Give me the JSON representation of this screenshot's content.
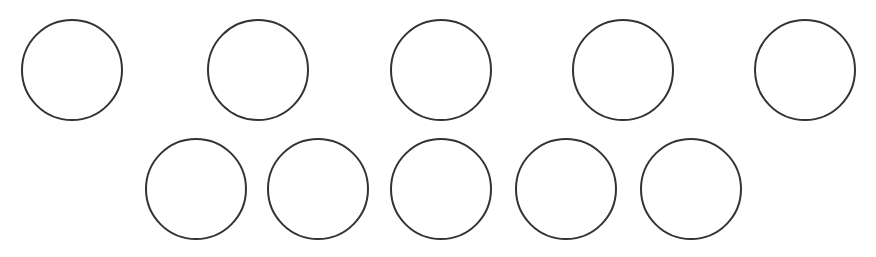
{
  "diagram": {
    "background": "#ffffff",
    "stroke_color": "#333333",
    "stroke_width": 2,
    "rows": [
      {
        "name": "top-row",
        "circles": [
          {
            "cx": 72,
            "cy": 70,
            "r": 51
          },
          {
            "cx": 258,
            "cy": 70,
            "r": 51
          },
          {
            "cx": 441,
            "cy": 70,
            "r": 51
          },
          {
            "cx": 623,
            "cy": 70,
            "r": 51
          },
          {
            "cx": 805,
            "cy": 70,
            "r": 51
          }
        ]
      },
      {
        "name": "bottom-row",
        "circles": [
          {
            "cx": 196,
            "cy": 189,
            "r": 51
          },
          {
            "cx": 318,
            "cy": 189,
            "r": 51
          },
          {
            "cx": 441,
            "cy": 189,
            "r": 51
          },
          {
            "cx": 566,
            "cy": 189,
            "r": 51
          },
          {
            "cx": 691,
            "cy": 189,
            "r": 51
          }
        ]
      }
    ]
  }
}
